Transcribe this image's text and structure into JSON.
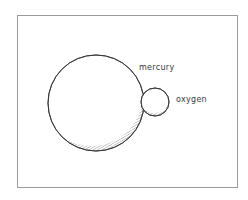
{
  "diagram": {
    "atoms": [
      {
        "name": "mercury",
        "label": "mercury",
        "cx": 96,
        "cy": 103,
        "r": 48
      },
      {
        "name": "oxygen",
        "label": "oxygen",
        "cx": 155,
        "cy": 102,
        "r": 14
      }
    ],
    "colors": {
      "stroke": "#333333",
      "frame": "#9a9a9a",
      "hatch": "#555555"
    }
  }
}
